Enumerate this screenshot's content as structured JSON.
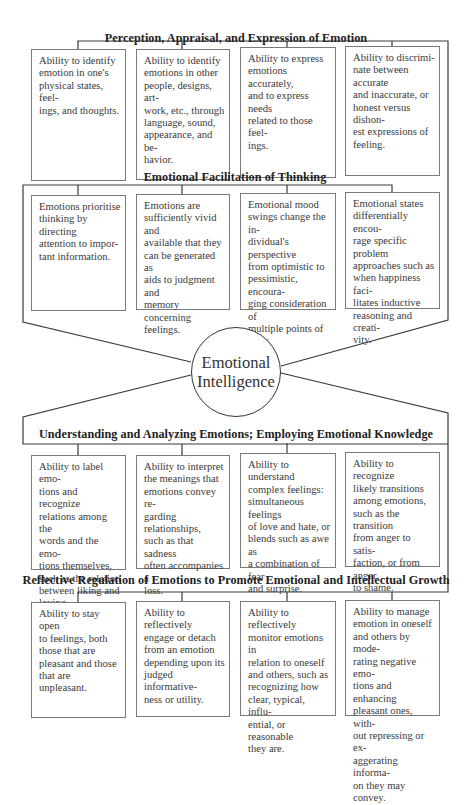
{
  "header_fragment": "",
  "center": {
    "label": "Emotional\nIntelligence"
  },
  "sections": [
    {
      "title": "Perception, Appraisal, and Expression of Emotion",
      "boxes": [
        "Ability to identify\nemotion in one's\nphysical states, feel-\nings, and thoughts.",
        "Ability to identify\nemotions in other\npeople, designs, art-\nwork, etc., through\nlanguage, sound,\nappearance, and be-\nhavior.",
        "Ability to express\nemotions accurately,\nand to express needs\nrelated to those feel-\nings.",
        "Ability to discrimi-\nnate between accurate\nand inaccurate, or\nhonest versus dishon-\nest expressions of\nfeeling."
      ]
    },
    {
      "title": "Emotional Facilitation of Thinking",
      "boxes": [
        "Emotions prioritise\nthinking by directing\nattention to impor-\ntant information.",
        "Emotions are\nsufficiently vivid and\navailable that they\ncan be generated as\naids to judgment and\nmemory concerning\nfeelings.",
        "Emotional mood\nswings change the in-\ndividual's perspective\nfrom optimistic to\npessimistic, encoura-\nging consideration of\nmultiple points of\nview.",
        "Emotional states\ndifferentially encou-\nrage specific problem\napproaches such as\nwhen happiness faci-\nlitates inductive\nreasoning and creati-\nvity."
      ]
    },
    {
      "title": "Understanding and Analyzing Emotions; Employing Emotional Knowledge",
      "boxes": [
        "Ability to label emo-\ntions and recognize\nrelations among the\nwords and the emo-\ntions themselves,\nsuch as the relation\nbetween liking and\nloving.",
        "Ability to interpret\nthe meanings that\nemotions convey re-\ngarding relationships,\nsuch as that sadness\noften accompanies a\nloss.",
        "Ability to understand\ncomplex feelings:\nsimultaneous feelings\nof love and hate, or\nblends such as awe as\na combination of fear\nand surprise.",
        "Ability to recognize\nlikely transitions\namong emotions,\nsuch as the transition\nfrom anger to satis-\nfaction, or from anger\nto shame."
      ]
    },
    {
      "title": "Reflective Regulation of Emotions to Promote Emotional and Intellectual Growth",
      "boxes": [
        "Ability to stay open\nto feelings, both\nthose that are\npleasant and those\nthat are unpleasant.",
        "Ability to reflectively\nengage or detach\nfrom an emotion\ndepending upon its\njudged informative-\nness or utility.",
        "Ability to reflectively\nmonitor emotions in\nrelation to oneself\nand others, such as\nrecognizing how\nclear, typical, influ-\nential, or reasonable\nthey are.",
        "Ability to manage\nemotion  in oneself\nand others by mode-\nrating negative emo-\ntions and enhancing\npleasant ones, with-\nout repressing or ex-\naggerating informa-\non they may convey."
      ]
    }
  ],
  "colors": {
    "line": "#333333",
    "box_border": "#7a7a7a",
    "text": "#3a3a3a"
  }
}
